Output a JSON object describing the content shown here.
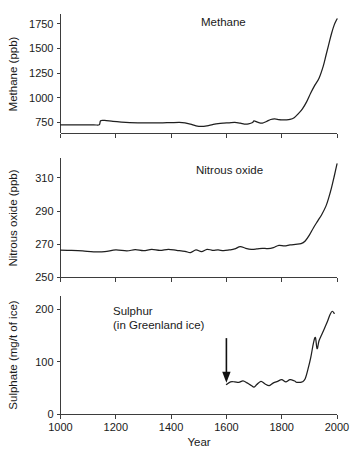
{
  "figure": {
    "title": "",
    "xlabel": "Year",
    "background": "#ffffff",
    "line_color": "#1f1f1f",
    "axis_color": "#3d3d3d"
  },
  "chart_data": [
    {
      "type": "line",
      "panel": "methane",
      "title": "Methane",
      "xlabel": "",
      "ylabel": "Methane (ppb)",
      "units": "ppb",
      "xlim": [
        1000,
        2000
      ],
      "ylim": [
        640,
        1850
      ],
      "xticks": [
        1000,
        1200,
        1400,
        1600,
        1800,
        2000
      ],
      "yticks": [
        750,
        1000,
        1250,
        1500,
        1750
      ],
      "grid": false,
      "legend": false,
      "x": [
        1000,
        1040,
        1080,
        1120,
        1140,
        1145,
        1160,
        1190,
        1220,
        1250,
        1280,
        1310,
        1340,
        1370,
        1400,
        1430,
        1450,
        1470,
        1490,
        1510,
        1530,
        1550,
        1570,
        1590,
        1610,
        1630,
        1650,
        1665,
        1680,
        1695,
        1700,
        1715,
        1730,
        1745,
        1760,
        1775,
        1790,
        1800,
        1815,
        1830,
        1845,
        1860,
        1875,
        1890,
        1905,
        1920,
        1935,
        1950,
        1960,
        1970,
        1980,
        1990,
        2000
      ],
      "y": [
        728,
        728,
        728,
        728,
        728,
        770,
        772,
        762,
        755,
        750,
        748,
        748,
        747,
        748,
        750,
        752,
        748,
        735,
        718,
        712,
        718,
        730,
        740,
        745,
        748,
        752,
        745,
        736,
        738,
        752,
        768,
        752,
        745,
        762,
        782,
        788,
        780,
        778,
        778,
        782,
        800,
        840,
        890,
        960,
        1050,
        1130,
        1200,
        1320,
        1430,
        1540,
        1650,
        1740,
        1800
      ]
    },
    {
      "type": "line",
      "panel": "nitrous-oxide",
      "title": "Nitrous oxide",
      "xlabel": "",
      "ylabel": "Nitrous oxide (ppb)",
      "units": "ppb",
      "xlim": [
        1000,
        2000
      ],
      "ylim": [
        250,
        322
      ],
      "xticks": [
        1000,
        1200,
        1400,
        1600,
        1800,
        2000
      ],
      "yticks": [
        250,
        270,
        290,
        310
      ],
      "grid": false,
      "legend": false,
      "x": [
        1000,
        1040,
        1080,
        1120,
        1160,
        1200,
        1240,
        1270,
        1300,
        1330,
        1360,
        1390,
        1420,
        1450,
        1470,
        1490,
        1510,
        1530,
        1550,
        1570,
        1590,
        1610,
        1630,
        1650,
        1670,
        1690,
        1710,
        1730,
        1750,
        1770,
        1790,
        1810,
        1830,
        1850,
        1870,
        1885,
        1900,
        1915,
        1930,
        1945,
        1960,
        1970,
        1980,
        1990,
        2000
      ],
      "y": [
        266.5,
        266.3,
        266.0,
        265.5,
        265.6,
        266.6,
        266.0,
        266.8,
        266.2,
        266.9,
        266.3,
        267.0,
        266.4,
        265.8,
        265.0,
        266.6,
        265.6,
        267.0,
        266.4,
        266.6,
        266.2,
        266.6,
        267.2,
        268.6,
        267.6,
        267.0,
        267.2,
        267.6,
        267.4,
        268.0,
        269.4,
        269.0,
        269.6,
        270.0,
        270.4,
        272.0,
        275.5,
        280.0,
        284.0,
        288.0,
        293.0,
        298.0,
        304.0,
        311.0,
        318.5
      ]
    },
    {
      "type": "line",
      "panel": "sulphur",
      "title": "Sulphur",
      "subtitle": "(in Greenland ice)",
      "xlabel": "Year",
      "ylabel": "Sulphate (mg/t of ice)",
      "units": "mg/t of ice",
      "xlim": [
        1000,
        2000
      ],
      "ylim": [
        0,
        225
      ],
      "xticks": [
        1000,
        1200,
        1400,
        1600,
        1800,
        2000
      ],
      "yticks": [
        0,
        100,
        200
      ],
      "grid": false,
      "legend": false,
      "annotation": {
        "type": "arrow",
        "x": 1600,
        "y_from": 145,
        "y_to": 68,
        "label": ""
      },
      "x": [
        1600,
        1615,
        1630,
        1645,
        1660,
        1675,
        1690,
        1700,
        1710,
        1725,
        1740,
        1755,
        1770,
        1785,
        1800,
        1815,
        1830,
        1845,
        1855,
        1865,
        1875,
        1885,
        1895,
        1905,
        1915,
        1922,
        1928,
        1935,
        1945,
        1955,
        1965,
        1975,
        1983,
        1990
      ],
      "y": [
        57,
        62,
        62,
        61,
        64,
        60,
        55,
        52,
        57,
        63,
        58,
        55,
        60,
        63,
        66,
        62,
        66,
        64,
        61,
        61,
        62,
        68,
        86,
        108,
        136,
        146,
        125,
        140,
        152,
        164,
        176,
        190,
        196,
        192
      ]
    }
  ]
}
